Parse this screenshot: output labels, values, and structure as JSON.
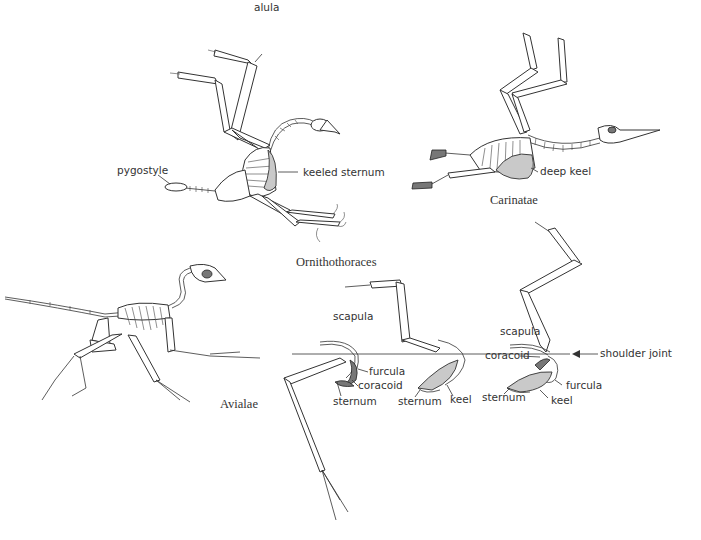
{
  "figure": {
    "panels": [
      {
        "id": "ornithothoraces-skeleton",
        "labels": {
          "alula": "alula",
          "pygostyle": "pygostyle",
          "keeled_sternum": "keeled sternum"
        },
        "taxon": "Ornithothoraces"
      },
      {
        "id": "carinatae-skeleton",
        "labels": {
          "deep_keel": "deep keel"
        },
        "taxon": "Carinatae"
      },
      {
        "id": "avialae-skeleton",
        "taxon": "Avialae"
      }
    ],
    "shoulder_series": {
      "left": {
        "scapula": "scapula",
        "furcula": "furcula",
        "coracoid": "coracoid",
        "sternum": "sternum"
      },
      "middle": {
        "sternum": "sternum",
        "keel": "keel"
      },
      "right": {
        "scapula": "scapula",
        "coracoid": "coracoid",
        "shoulder_joint": "shoulder joint",
        "furcula": "furcula",
        "sternum": "sternum",
        "keel": "keel"
      }
    }
  }
}
